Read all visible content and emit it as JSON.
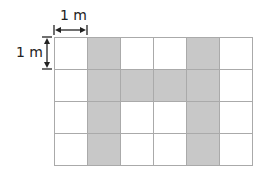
{
  "diagram": {
    "horizontal_label": "1 m",
    "vertical_label": "1 m",
    "grid": {
      "columns": 6,
      "rows": 4,
      "shaded_color": "#c8c8c8",
      "line_color": "#aaaaaa",
      "cells": [
        [
          0,
          1,
          0,
          0,
          1,
          0
        ],
        [
          0,
          1,
          1,
          1,
          1,
          0
        ],
        [
          0,
          1,
          0,
          0,
          1,
          0
        ],
        [
          0,
          1,
          0,
          0,
          1,
          0
        ]
      ]
    }
  }
}
